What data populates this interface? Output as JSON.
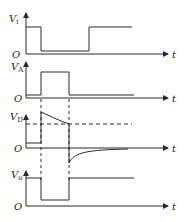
{
  "diagram": {
    "type": "timing-diagram",
    "stroke_color": "#2a2a2a",
    "panels": [
      {
        "id": "vi",
        "y_label": "V",
        "y_sub": "i",
        "x_label": "t",
        "origin_label": "O"
      },
      {
        "id": "va",
        "y_label": "V",
        "y_sub": "A",
        "x_label": "t",
        "origin_label": "O"
      },
      {
        "id": "vd",
        "y_label": "V",
        "y_sub": "D",
        "x_label": "t",
        "origin_label": "O"
      },
      {
        "id": "vo",
        "y_label": "V",
        "y_sub": "o",
        "x_label": "t",
        "origin_label": "O"
      }
    ]
  }
}
